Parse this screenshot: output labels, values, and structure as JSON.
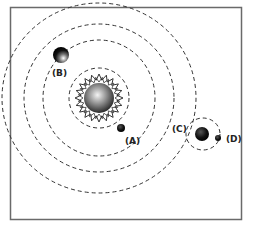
{
  "diagram": {
    "frame": {
      "x": 10,
      "y": 7,
      "width": 231,
      "height": 212,
      "stroke": "#666666"
    },
    "star": {
      "cx": 99,
      "cy": 98,
      "r": 15,
      "corona_r": 24,
      "corona_points": 20
    },
    "orbits": [
      {
        "id": "orbit-a",
        "cx": 99,
        "cy": 98,
        "rx": 30,
        "ry": 30
      },
      {
        "id": "orbit-2",
        "cx": 99,
        "cy": 98,
        "rx": 56,
        "ry": 58
      },
      {
        "id": "orbit-b",
        "cx": 99,
        "cy": 98,
        "rx": 75,
        "ry": 74
      },
      {
        "id": "orbit-4",
        "cx": 99,
        "cy": 98,
        "rx": 97,
        "ry": 95
      },
      {
        "id": "orbit-d",
        "cx": 203,
        "cy": 134,
        "rx": 17,
        "ry": 16
      }
    ],
    "bodies": [
      {
        "id": "A",
        "label": "(A)",
        "cx": 121,
        "cy": 128,
        "r": 4,
        "label_x": 125,
        "label_y": 144
      },
      {
        "id": "B",
        "label": "(B)",
        "cx": 61,
        "cy": 55,
        "r": 8,
        "label_x": 52,
        "label_y": 76
      },
      {
        "id": "C",
        "label": "(C)",
        "cx": 202,
        "cy": 134,
        "r": 7,
        "label_x": 172,
        "label_y": 132
      },
      {
        "id": "D",
        "label": "(D)",
        "cx": 218,
        "cy": 138,
        "r": 3,
        "label_x": 226,
        "label_y": 142
      }
    ]
  }
}
